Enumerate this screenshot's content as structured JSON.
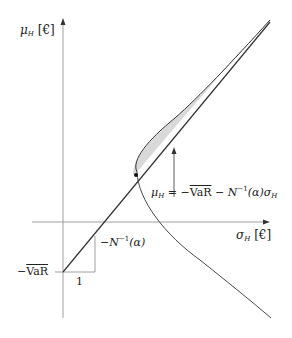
{
  "diagram": {
    "y_axis_label": {
      "var": "μ",
      "sub": "H",
      "unit": "[€]"
    },
    "x_axis_label": {
      "var": "σ",
      "sub": "H",
      "unit": "[€]"
    },
    "intercept_label": {
      "prefix": "−",
      "text": "VaR"
    },
    "slope_run_label": "1",
    "slope_rise_label": {
      "prefix": "−N",
      "sup": "−1",
      "suffix": "(α)"
    },
    "line_equation": {
      "lhs_var": "μ",
      "lhs_sub": "H",
      "eq": " = −",
      "var_text": "VaR",
      "mid": " − N",
      "sup": "−1",
      "tail": "(α)σ",
      "tail_sub": "H"
    },
    "colors": {
      "stroke": "#333333",
      "axis": "#888888",
      "shade": "#d9d9d9"
    }
  }
}
